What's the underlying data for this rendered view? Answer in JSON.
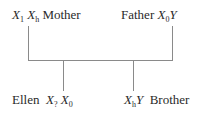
{
  "diagram": {
    "type": "pedigree",
    "mother": {
      "label": "Mother",
      "allele1": "X",
      "allele1_sub": "1",
      "allele2": "X",
      "allele2_sub": "h"
    },
    "father": {
      "label": "Father",
      "allele1": "X",
      "allele1_sub": "0",
      "allele2": "Y"
    },
    "daughter": {
      "label": "Ellen",
      "allele1": "X",
      "allele1_sub": "?",
      "allele2": "X",
      "allele2_sub": "0"
    },
    "son": {
      "label": "Brother",
      "allele1": "X",
      "allele1_sub": "h",
      "allele2": "Y"
    }
  }
}
